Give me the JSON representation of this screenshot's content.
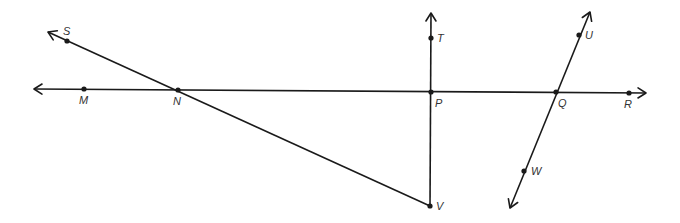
{
  "diagram": {
    "type": "geometry-lines",
    "lines": [
      {
        "name": "line-MR",
        "kind": "line",
        "from": [
          34,
          89
        ],
        "to": [
          646,
          93
        ],
        "through": [
          "M",
          "N",
          "P",
          "Q",
          "R"
        ]
      },
      {
        "name": "ray-NS",
        "kind": "ray",
        "from": [
          430,
          206
        ],
        "to": [
          48,
          32
        ],
        "through": [
          "V",
          "N",
          "S"
        ]
      },
      {
        "name": "ray-PT",
        "kind": "ray",
        "from": [
          430,
          206
        ],
        "to": [
          431,
          13
        ],
        "through": [
          "V",
          "P",
          "T"
        ]
      },
      {
        "name": "line-UW",
        "kind": "line",
        "from": [
          510,
          208
        ],
        "to": [
          590,
          12
        ],
        "through": [
          "W",
          "Q",
          "U"
        ]
      }
    ],
    "points": [
      {
        "id": "S",
        "label": "S",
        "x": 67,
        "y": 41,
        "lx": 63,
        "ly": 35
      },
      {
        "id": "M",
        "label": "M",
        "x": 84,
        "y": 89,
        "lx": 79,
        "ly": 104
      },
      {
        "id": "N",
        "label": "N",
        "x": 178,
        "y": 90,
        "lx": 173,
        "ly": 105
      },
      {
        "id": "T",
        "label": "T",
        "x": 431,
        "y": 38,
        "lx": 437,
        "ly": 42
      },
      {
        "id": "P",
        "label": "P",
        "x": 431,
        "y": 92,
        "lx": 435,
        "ly": 107
      },
      {
        "id": "Q",
        "label": "Q",
        "x": 556,
        "y": 92,
        "lx": 558,
        "ly": 107
      },
      {
        "id": "R",
        "label": "R",
        "x": 629,
        "y": 93,
        "lx": 624,
        "ly": 108
      },
      {
        "id": "U",
        "label": "U",
        "x": 579,
        "y": 35,
        "lx": 585,
        "ly": 39
      },
      {
        "id": "W",
        "label": "W",
        "x": 524,
        "y": 171,
        "lx": 531,
        "ly": 175
      },
      {
        "id": "V",
        "label": "V",
        "x": 430,
        "y": 206,
        "lx": 436,
        "ly": 210
      }
    ]
  }
}
